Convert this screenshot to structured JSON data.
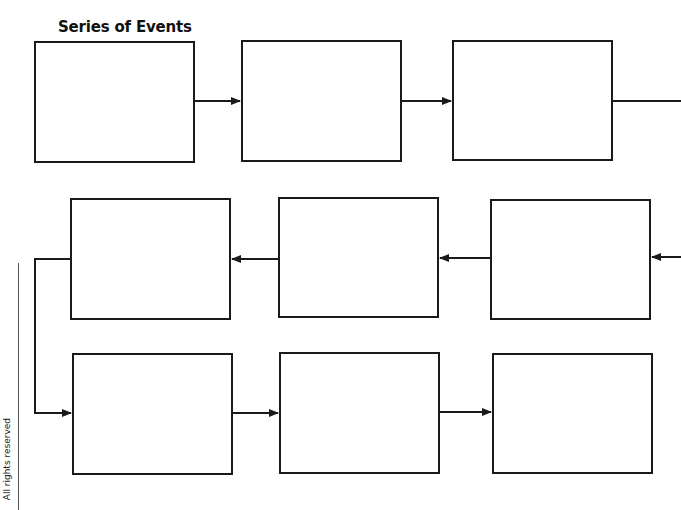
{
  "title": "Series of Events",
  "footer": {
    "copyright": "All rights reserved"
  },
  "colors": {
    "stroke": "#1a1a1a",
    "background": "#ffffff"
  },
  "diagram": {
    "type": "flow-chart",
    "layout": "serpentine 3x3",
    "boxes": [
      {
        "id": 1,
        "row": 1,
        "col": 1,
        "label": ""
      },
      {
        "id": 2,
        "row": 1,
        "col": 2,
        "label": ""
      },
      {
        "id": 3,
        "row": 1,
        "col": 3,
        "label": ""
      },
      {
        "id": 4,
        "row": 2,
        "col": 3,
        "label": ""
      },
      {
        "id": 5,
        "row": 2,
        "col": 2,
        "label": ""
      },
      {
        "id": 6,
        "row": 2,
        "col": 1,
        "label": ""
      },
      {
        "id": 7,
        "row": 3,
        "col": 1,
        "label": ""
      },
      {
        "id": 8,
        "row": 3,
        "col": 2,
        "label": ""
      },
      {
        "id": 9,
        "row": 3,
        "col": 3,
        "label": ""
      }
    ],
    "connections": [
      {
        "from": 1,
        "to": 2
      },
      {
        "from": 2,
        "to": 3
      },
      {
        "from": 3,
        "to": 4
      },
      {
        "from": 4,
        "to": 5
      },
      {
        "from": 5,
        "to": 6
      },
      {
        "from": 6,
        "to": 7
      },
      {
        "from": 7,
        "to": 8
      },
      {
        "from": 8,
        "to": 9
      }
    ]
  }
}
